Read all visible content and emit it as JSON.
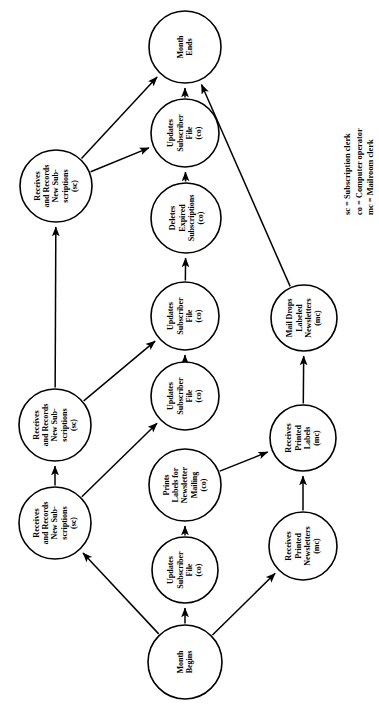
{
  "diagram": {
    "orientation": "rotated-90-ccw",
    "stroke_color": "#000000",
    "background_color": "#ffffff",
    "nodes": [
      {
        "id": "month-begins",
        "label": "Month\nBegins",
        "cx": 185,
        "cy": 662,
        "r": 37
      },
      {
        "id": "updates-sub-file-1",
        "label": "Updates\nSubscriber\nFile\n(co)",
        "cx": 185,
        "cy": 570,
        "r": 33
      },
      {
        "id": "prints-labels",
        "label": "Prints\nLabels for\nNewsletter\nMailing\n(co)",
        "cx": 185,
        "cy": 485,
        "r": 36
      },
      {
        "id": "updates-sub-file-2",
        "label": "Updates\nSubscriber\nFile\n(co)",
        "cx": 185,
        "cy": 396,
        "r": 34
      },
      {
        "id": "updates-sub-file-3",
        "label": "Updates\nSubscriber\nFile\n(co)",
        "cx": 185,
        "cy": 316,
        "r": 34
      },
      {
        "id": "deletes-expired",
        "label": "Deletes\nExpired\nSubscriptions\n(co)",
        "cx": 186,
        "cy": 218,
        "r": 35
      },
      {
        "id": "updates-sub-file-4",
        "label": "Updates\nSubscriber\nFile\n(co)",
        "cx": 185,
        "cy": 133,
        "r": 34
      },
      {
        "id": "month-ends",
        "label": "Month\nEnds",
        "cx": 185,
        "cy": 47,
        "r": 36
      },
      {
        "id": "receives-records-1",
        "label": "Receives\nand Records\nNew Sub-\nscriptions\n(sc)",
        "cx": 55,
        "cy": 523,
        "r": 36
      },
      {
        "id": "receives-records-2",
        "label": "Receives\nand Records\nNew Sub-\nscriptions\n(sc)",
        "cx": 55,
        "cy": 425,
        "r": 36
      },
      {
        "id": "receives-records-3",
        "label": "Receives\nand Records\nNew Sub-\nscriptions\n(sc)",
        "cx": 56,
        "cy": 186,
        "r": 36
      },
      {
        "id": "receives-newsletters",
        "label": "Receives\nPrinted\nNewsletters\n(mc)",
        "cx": 303,
        "cy": 546,
        "r": 34
      },
      {
        "id": "receives-labels",
        "label": "Receives\nPrinted\nLabels\n(mc)",
        "cx": 303,
        "cy": 438,
        "r": 33
      },
      {
        "id": "mail-drops",
        "label": "Mail Drops\nLabeled\nNewsletters\n(mc)",
        "cx": 304,
        "cy": 318,
        "r": 33
      }
    ],
    "edges": [
      {
        "id": "e-begins-updates1",
        "from": "month-begins",
        "to": "updates-sub-file-1"
      },
      {
        "id": "e-begins-records1",
        "from": "month-begins",
        "to": "receives-records-1"
      },
      {
        "id": "e-begins-newsletters",
        "from": "month-begins",
        "to": "receives-newsletters"
      },
      {
        "id": "e-updates1-prints",
        "from": "updates-sub-file-1",
        "to": "prints-labels"
      },
      {
        "id": "e-prints-labels",
        "from": "prints-labels",
        "to": "receives-labels"
      },
      {
        "id": "e-newsletters-labels",
        "from": "receives-newsletters",
        "to": "receives-labels"
      },
      {
        "id": "e-labels-maildrops",
        "from": "receives-labels",
        "to": "mail-drops"
      },
      {
        "id": "e-records1-updates2",
        "from": "receives-records-1",
        "to": "updates-sub-file-2"
      },
      {
        "id": "e-records1-records2",
        "from": "receives-records-1",
        "to": "receives-records-2"
      },
      {
        "id": "e-updates2-updates3",
        "from": "updates-sub-file-2",
        "to": "updates-sub-file-3"
      },
      {
        "id": "e-records2-updates3",
        "from": "receives-records-2",
        "to": "updates-sub-file-3"
      },
      {
        "id": "e-records2-records3",
        "from": "receives-records-2",
        "to": "receives-records-3"
      },
      {
        "id": "e-updates3-deletes",
        "from": "updates-sub-file-3",
        "to": "deletes-expired"
      },
      {
        "id": "e-deletes-updates4",
        "from": "deletes-expired",
        "to": "updates-sub-file-4"
      },
      {
        "id": "e-records3-updates4",
        "from": "receives-records-3",
        "to": "updates-sub-file-4"
      },
      {
        "id": "e-records3-ends",
        "from": "receives-records-3",
        "to": "month-ends"
      },
      {
        "id": "e-updates4-ends",
        "from": "updates-sub-file-4",
        "to": "month-ends"
      },
      {
        "id": "e-maildrops-ends",
        "from": "mail-drops",
        "to": "month-ends"
      }
    ]
  },
  "legend": {
    "lines": [
      "sc = Subscription clerk",
      "co = Computer operator",
      "mc = Mailroom clerk"
    ],
    "x": 342,
    "y": 215
  }
}
